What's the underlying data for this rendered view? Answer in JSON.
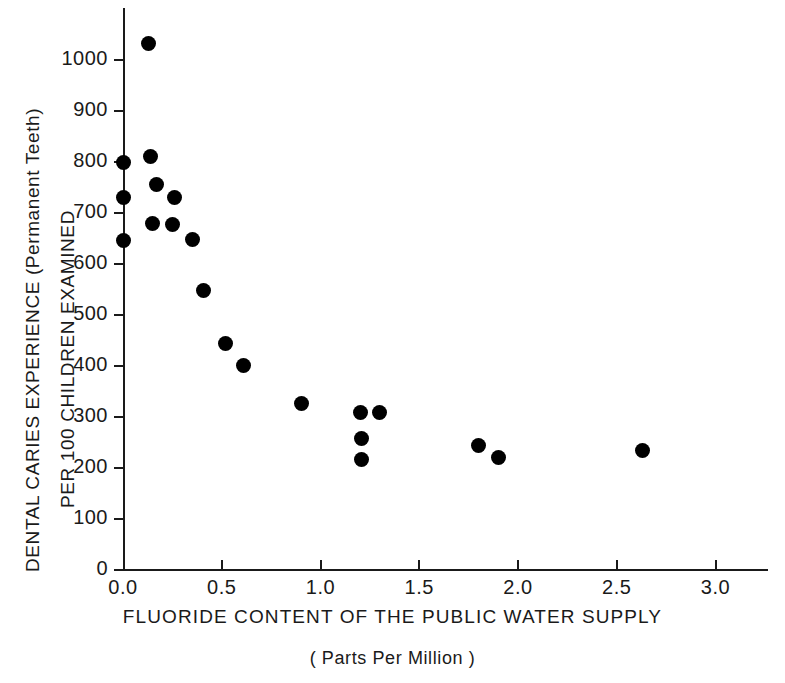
{
  "chart_data": {
    "type": "scatter",
    "title": "",
    "xlabel": "FLUORIDE CONTENT OF THE PUBLIC WATER SUPPLY",
    "xlabel_sub": "( Parts Per Million )",
    "ylabel": "DENTAL CARIES EXPERIENCE (Permanent Teeth)",
    "ylabel_secondary": "PER 100 CHILDREN EXAMINED",
    "xlim": [
      0.0,
      3.25
    ],
    "ylim": [
      0,
      1075
    ],
    "grid": false,
    "legend": null,
    "xticks": [
      0.0,
      0.5,
      1.0,
      1.5,
      2.0,
      2.5,
      3.0
    ],
    "xticklabels": [
      "0.0",
      "0.5",
      "1.0",
      "1.5",
      "2.0",
      "2.5",
      "3.0"
    ],
    "yticks": [
      0,
      100,
      200,
      300,
      400,
      500,
      600,
      700,
      800,
      900,
      1000
    ],
    "yticklabels": [
      "0",
      "100",
      "200",
      "300",
      "400",
      "500",
      "600",
      "700",
      "800",
      "900",
      "1000"
    ],
    "marker": "filled-circle",
    "marker_color": "#000000",
    "axis_color": "#1a1a1a",
    "background_color": "#ffffff",
    "point_count": 21,
    "points": [
      {
        "x": 0.13,
        "y": 1032
      },
      {
        "x": 0.0,
        "y": 800
      },
      {
        "x": 0.14,
        "y": 810
      },
      {
        "x": 0.17,
        "y": 755
      },
      {
        "x": 0.0,
        "y": 731
      },
      {
        "x": 0.26,
        "y": 730
      },
      {
        "x": 0.15,
        "y": 680
      },
      {
        "x": 0.25,
        "y": 677
      },
      {
        "x": 0.0,
        "y": 646
      },
      {
        "x": 0.35,
        "y": 649
      },
      {
        "x": 0.41,
        "y": 548
      },
      {
        "x": 0.52,
        "y": 445
      },
      {
        "x": 0.61,
        "y": 401
      },
      {
        "x": 0.905,
        "y": 327
      },
      {
        "x": 1.2,
        "y": 309
      },
      {
        "x": 1.3,
        "y": 309
      },
      {
        "x": 1.21,
        "y": 257
      },
      {
        "x": 1.21,
        "y": 216
      },
      {
        "x": 1.8,
        "y": 244
      },
      {
        "x": 1.9,
        "y": 221
      },
      {
        "x": 2.63,
        "y": 234
      }
    ]
  }
}
